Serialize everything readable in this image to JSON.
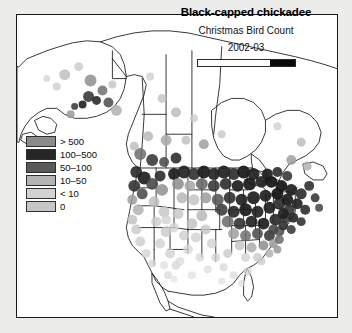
{
  "figure": {
    "background_color": "#ececeb",
    "panel_background": "#ffffff",
    "panel_border_color": "#1a1a1a"
  },
  "title_block": {
    "species": "Black-capped chickadee",
    "survey": "Christmas Bird Count",
    "season": "2002-03",
    "scale_bar": {
      "name": "scale-bar",
      "fill_fraction_percent": 25,
      "fill_color": "#0b0b0b",
      "track_color": "#fdfdfd"
    }
  },
  "legend": {
    "name": "abundance-legend",
    "items": [
      {
        "label": "> 500",
        "color": "#8a8a8a"
      },
      {
        "label": "100–500",
        "color": "#262626"
      },
      {
        "label": "50–100",
        "color": "#5a5a5a"
      },
      {
        "label": "10–50",
        "color": "#b4b4b4"
      },
      {
        "label": "< 10",
        "color": "#d2d2d2"
      },
      {
        "label": "0",
        "color": "#c6c6c6"
      }
    ]
  },
  "chart_data": {
    "type": "map",
    "title": "Black-capped chickadee",
    "subtitle": "Christmas Bird Count",
    "period": "2002-03",
    "region": "North America",
    "variable": "Birds counted per count circle",
    "classes": [
      "0",
      "< 10",
      "10–50",
      "50–100",
      "100–500",
      "> 500"
    ],
    "class_colors": [
      "#c6c6c6",
      "#d2d2d2",
      "#b4b4b4",
      "#5a5a5a",
      "#262626",
      "#8a8a8a"
    ]
  }
}
